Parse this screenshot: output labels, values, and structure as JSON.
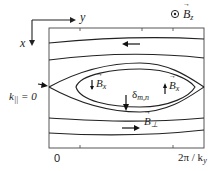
{
  "diagram": {
    "type": "magnetic island schematic",
    "axes": {
      "y_axis_label": "y",
      "x_axis_label": "x"
    },
    "bz_symbol": "⊙",
    "bz_label": "B",
    "bz_sub": "z",
    "left_marker": "k",
    "left_marker_sub": "||",
    "left_marker_tail": " = 0",
    "bottom_left_tick": "0",
    "bottom_right_tick_prefix": "2π / k",
    "bottom_right_tick_sub": "y",
    "island": {
      "left_field_label": "B",
      "left_field_sub": "x",
      "right_field_label": "B",
      "right_field_sub": "x",
      "width_label": "δ",
      "width_sub": "m,n"
    },
    "perp_field_label": "B",
    "perp_field_sub": "⊥",
    "colors": {
      "line": "#222222",
      "background": "#ffffff"
    }
  }
}
